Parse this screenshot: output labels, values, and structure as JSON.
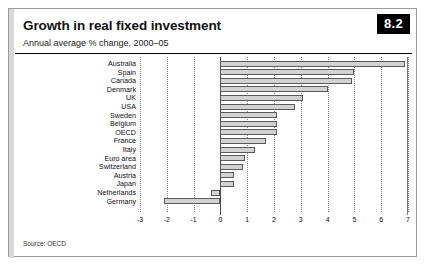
{
  "figure": {
    "badge": "8.2",
    "title": "Growth in real fixed investment",
    "subtitle": "Annual average % change, 2000–05",
    "source": "Source: OECD"
  },
  "chart_data": {
    "type": "bar",
    "orientation": "horizontal",
    "title": "Growth in real fixed investment",
    "subtitle": "Annual average % change, 2000–05",
    "xlabel": "",
    "ylabel": "",
    "xlim": [
      -3,
      7
    ],
    "xticks": [
      -3,
      -2,
      -1,
      0,
      1,
      2,
      3,
      4,
      5,
      6,
      7
    ],
    "xtick_labels": [
      "-3",
      "-2",
      "-1",
      "0",
      "1",
      "2",
      "3",
      "4",
      "5",
      "6",
      "7"
    ],
    "grid": "vertical-dotted",
    "legend": "none",
    "categories": [
      "Australia",
      "Spain",
      "Canada",
      "Denmark",
      "UK",
      "USA",
      "Sweden",
      "Belgium",
      "OECD",
      "France",
      "Italy",
      "Euro area",
      "Switzerland",
      "Austria",
      "Japan",
      "Netherlands",
      "Germany"
    ],
    "values": [
      6.9,
      5.0,
      4.9,
      4.0,
      3.1,
      2.8,
      2.1,
      2.1,
      2.1,
      1.7,
      1.3,
      0.9,
      0.85,
      0.5,
      0.5,
      -0.35,
      -2.1
    ],
    "bar_fill": "#d2d2d2",
    "bar_edge": "#5a5a5a",
    "source": "Source: OECD"
  }
}
